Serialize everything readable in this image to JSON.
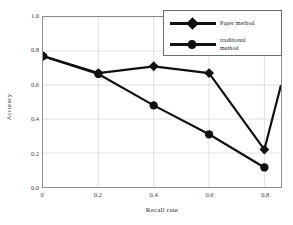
{
  "chart_data": {
    "type": "line",
    "title": "",
    "xlabel": "Recall rate",
    "ylabel": "Accuracy",
    "xlim": [
      0,
      0.86
    ],
    "ylim": [
      0,
      1.0
    ],
    "grid": true,
    "legend_position": "top-right",
    "xticks": [
      "0",
      "0.2",
      "0.4",
      "0.6",
      "0.8"
    ],
    "xtick_values": [
      0,
      0.2,
      0.4,
      0.6,
      0.8
    ],
    "yticks": [
      "0.0",
      "0.2",
      "0.4",
      "0.6",
      "0.8",
      "1.0"
    ],
    "ytick_values": [
      0.0,
      0.2,
      0.4,
      0.6,
      0.8,
      1.0
    ],
    "x": [
      0,
      0.2,
      0.4,
      0.6,
      0.8
    ],
    "series": [
      {
        "name": "Paper method",
        "marker": "diamond",
        "color": "#111111",
        "values": [
          0.77,
          0.67,
          0.71,
          0.67,
          0.22
        ],
        "trailing_segment_to": {
          "x": 0.86,
          "y": 0.6
        }
      },
      {
        "name": "traditional method",
        "marker": "circle",
        "color": "#111111",
        "values": [
          0.77,
          0.665,
          0.48,
          0.31,
          0.115
        ]
      }
    ]
  },
  "legend": {
    "entries": [
      {
        "label": "Paper method",
        "label_line2": ""
      },
      {
        "label": "traditional",
        "label_line2": "method"
      }
    ]
  },
  "colors": {
    "line": "#111111",
    "frame": "#8f8f8f",
    "grid": "#d8d8d8",
    "background": "#ffffff",
    "text": "#2b2b2b"
  }
}
